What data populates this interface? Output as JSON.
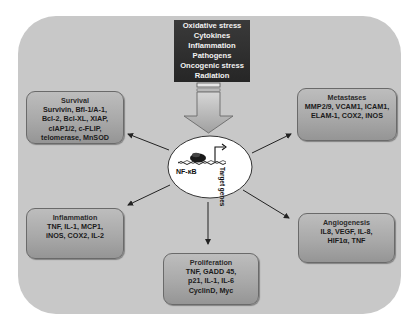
{
  "diagram": {
    "center": {
      "label": "NF-κB",
      "side_label": "Target genes"
    },
    "stimuli": {
      "items": [
        "Oxidative stress",
        "Cytokines",
        "Inflammation",
        "Pathogens",
        "Oncogenic stress",
        "Radiation"
      ]
    },
    "boxes": {
      "survival": {
        "title": "Survival",
        "lines": [
          "Survivin, Bfl-1/A-1,",
          "Bcl-2, Bcl-XL, XIAP,",
          "cIAP1/2, c-FLIP,",
          "telomerase, MnSOD"
        ]
      },
      "metastases": {
        "title": "Metastases",
        "lines": [
          "MMP2/9, VCAM1, ICAM1,",
          "ELAM-1, COX2, iNOS"
        ]
      },
      "inflammation": {
        "title": "Inflammation",
        "lines": [
          "TNF, IL-1, MCP1,",
          "iNOS, COX2, IL-2"
        ]
      },
      "angiogenesis": {
        "title": "Angiogenesis",
        "lines": [
          "IL8, VEGF, IL-8,",
          "HIF1α, TNF"
        ]
      },
      "proliferation": {
        "title": "Proliferation",
        "lines": [
          "TNF, GADD 45,",
          "p21, IL-1, IL-6",
          "CyclinD, Myc"
        ]
      }
    },
    "colors": {
      "panel": "#c8c8c8",
      "stimuli_box": "#2e2e2e",
      "node": "#ffffff",
      "arrow": "#222222"
    }
  }
}
